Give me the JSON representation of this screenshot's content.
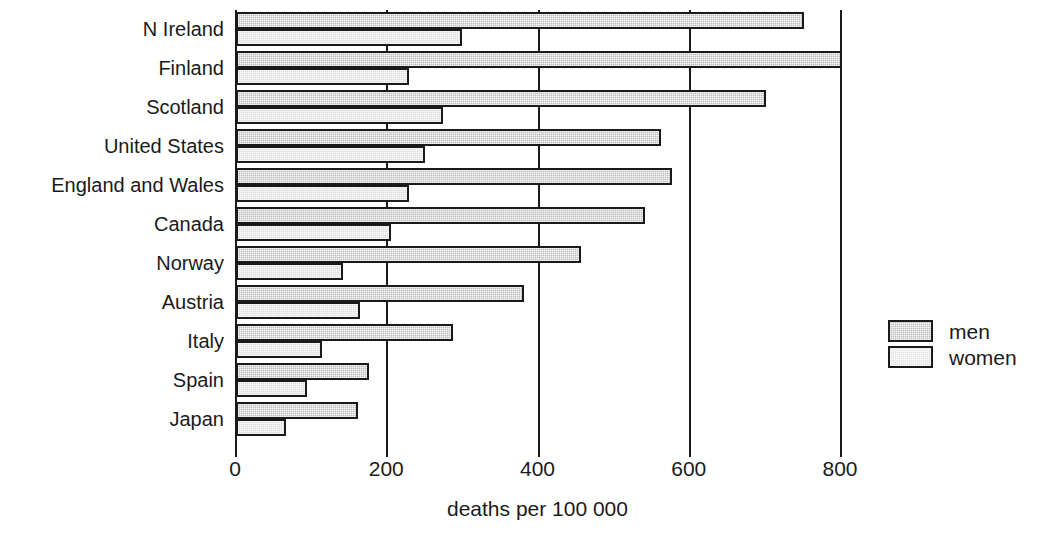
{
  "chart_data": {
    "type": "bar",
    "orientation": "horizontal",
    "title": "",
    "subtitle": "",
    "xlabel": "deaths per 100 000",
    "ylabel": "",
    "xlim": [
      0,
      840
    ],
    "xticks": [
      0,
      200,
      400,
      600,
      800
    ],
    "xtick_labels": [
      "0",
      "200",
      "400",
      "600",
      "800"
    ],
    "grid": "vertical gridlines at each x tick",
    "legend_position": "right",
    "categories": [
      "N Ireland",
      "Finland",
      "Scotland",
      "United States",
      "England and Wales",
      "Canada",
      "Norway",
      "Austria",
      "Italy",
      "Spain",
      "Japan"
    ],
    "series": [
      {
        "name": "men",
        "color": "#bcbcbc",
        "values": [
          750,
          800,
          700,
          560,
          575,
          540,
          455,
          380,
          285,
          175,
          160
        ]
      },
      {
        "name": "women",
        "color": "#dedede",
        "values": [
          297,
          228,
          272,
          248,
          228,
          204,
          140,
          162,
          113,
          92,
          65
        ]
      }
    ]
  },
  "legend": {
    "items": [
      {
        "label": "men",
        "swatch": "men"
      },
      {
        "label": "women",
        "swatch": "women"
      }
    ]
  },
  "axis": {
    "x_label": "deaths per 100 000"
  }
}
